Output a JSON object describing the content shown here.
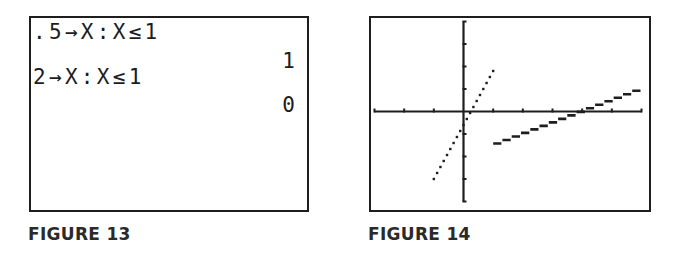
{
  "figures": [
    {
      "caption": "FIGURE 13",
      "type": "calculator-home-screen",
      "lines": [
        {
          "input": ".5→X:X≤1",
          "result": "1"
        },
        {
          "input": "2→X:X≤1",
          "result": "0"
        }
      ]
    },
    {
      "caption": "FIGURE 14",
      "type": "calculator-graph-screen"
    }
  ],
  "chart_data": {
    "type": "line",
    "title": "",
    "caption": "FIGURE 14",
    "xlabel": "",
    "ylabel": "",
    "xlim": [
      -3,
      6
    ],
    "ylim": [
      -4,
      4
    ],
    "xscale": 1,
    "yscale": 1,
    "grid": false,
    "legend": null,
    "series": [
      {
        "name": "left piece (dotted, x ≤ 1)",
        "style": "dotted",
        "x": [
          -1,
          1
        ],
        "y": [
          -3,
          1.8
        ]
      },
      {
        "name": "right piece (x > 1)",
        "style": "connected",
        "formula": "y = 0.5x - 2",
        "x": [
          1,
          6
        ],
        "y": [
          -1.5,
          1
        ]
      }
    ],
    "colors": {
      "axes": "#1e1e1e",
      "plot": "#1e1e1e",
      "frame": "#1e1e1e"
    }
  }
}
